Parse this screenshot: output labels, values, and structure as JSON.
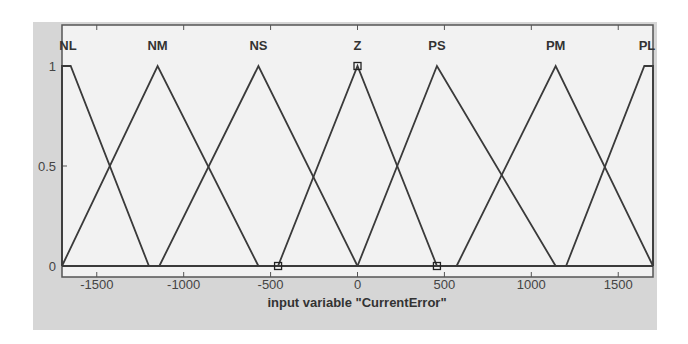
{
  "chart_data": {
    "type": "line",
    "title": "",
    "xlabel": "input variable \"CurrentError\"",
    "ylabel": "",
    "xlim": [
      -1700,
      1700
    ],
    "ylim": [
      0,
      1
    ],
    "x_ticks": [
      -1500,
      -1000,
      -500,
      0,
      500,
      1000,
      1500
    ],
    "x_tick_labels": [
      "-1500",
      "-1000",
      "-500",
      "0",
      "500",
      "1000",
      "1500"
    ],
    "y_ticks": [
      0,
      0.5,
      1
    ],
    "y_tick_labels": [
      "0",
      "0.5",
      "1"
    ],
    "grid": false,
    "legend": "none",
    "series": [
      {
        "name": "NL",
        "shape": "trapezoid",
        "x": [
          -1700,
          -1700,
          -1650,
          -1200
        ],
        "y": [
          0,
          1,
          1,
          0
        ]
      },
      {
        "name": "NM",
        "shape": "triangle",
        "x": [
          -1700,
          -1150,
          -570
        ],
        "y": [
          0,
          1,
          0
        ]
      },
      {
        "name": "NS",
        "shape": "triangle",
        "x": [
          -1140,
          -570,
          0
        ],
        "y": [
          0,
          1,
          0
        ]
      },
      {
        "name": "Z",
        "shape": "triangle",
        "x": [
          -457,
          0,
          457
        ],
        "y": [
          0,
          1,
          0
        ],
        "selected": true
      },
      {
        "name": "PS",
        "shape": "triangle",
        "x": [
          0,
          457,
          1140
        ],
        "y": [
          0,
          1,
          0
        ]
      },
      {
        "name": "PM",
        "shape": "triangle",
        "x": [
          570,
          1140,
          1700
        ],
        "y": [
          0,
          1,
          0
        ]
      },
      {
        "name": "PL",
        "shape": "trapezoid",
        "x": [
          1200,
          1650,
          1700,
          1700
        ],
        "y": [
          0,
          1,
          1,
          0
        ]
      }
    ],
    "markers": [
      {
        "x": -457,
        "y": 0,
        "shape": "square"
      },
      {
        "x": 0,
        "y": 1,
        "shape": "square"
      },
      {
        "x": 457,
        "y": 0,
        "shape": "square"
      }
    ]
  },
  "colors": {
    "background": "#ffffff",
    "frame": "#d6d6d6",
    "plot_bg": "#f2f2f2",
    "line": "#3a3a3a"
  }
}
